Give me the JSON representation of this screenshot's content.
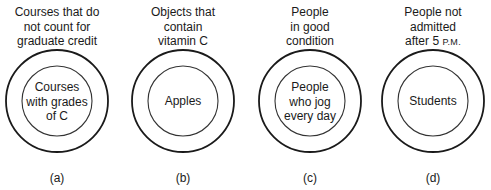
{
  "diagrams": [
    {
      "id": "a",
      "outer_label": [
        "Courses that do",
        "not count for",
        "graduate credit"
      ],
      "inner_label": [
        "Courses",
        "with grades",
        "of C"
      ],
      "caption": "(a)"
    },
    {
      "id": "b",
      "outer_label": [
        "Objects that",
        "contain",
        "vitamin C"
      ],
      "inner_label": [
        "Apples"
      ],
      "caption": "(b)"
    },
    {
      "id": "c",
      "outer_label": [
        "People",
        "in good",
        "condition"
      ],
      "inner_label": [
        "People",
        "who jog",
        "every day"
      ],
      "caption": "(c)"
    },
    {
      "id": "d",
      "outer_label": [
        "People not",
        "admitted",
        "after 5"
      ],
      "outer_label_suffix": "P.M.",
      "inner_label": [
        "Students"
      ],
      "caption": "(d)"
    }
  ],
  "colors": {
    "stroke": "#1a1a1a",
    "inner_stroke": "#333333",
    "background": "#ffffff"
  }
}
